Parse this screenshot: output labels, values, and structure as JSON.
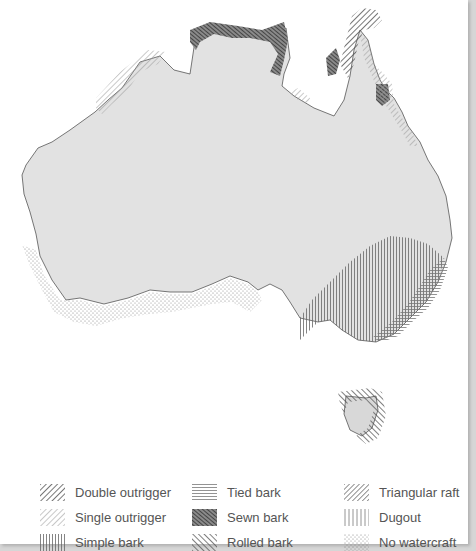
{
  "map": {
    "title": "Aboriginal watercraft distribution in Australia",
    "regions": [
      {
        "name": "Kimberley coast",
        "type": "Single outrigger"
      },
      {
        "name": "Arnhem Land coast",
        "type": "Sewn bark"
      },
      {
        "name": "Cape York",
        "type": "Double outrigger"
      },
      {
        "name": "Gulf of Carpentaria coast",
        "type": "Single outrigger"
      },
      {
        "name": "Queensland east coast",
        "type": "Single outrigger"
      },
      {
        "name": "Murray-Darling / south-east",
        "type": "Simple bark"
      },
      {
        "name": "NSW coast",
        "type": "Tied bark"
      },
      {
        "name": "Southern coast",
        "type": "No watercraft"
      },
      {
        "name": "Tasmania",
        "type": "Rolled bark"
      }
    ]
  },
  "legend": {
    "items": [
      {
        "id": "double-outrigger",
        "label": "Double outrigger"
      },
      {
        "id": "single-outrigger",
        "label": "Single outrigger"
      },
      {
        "id": "simple-bark",
        "label": "Simple bark"
      },
      {
        "id": "tied-bark",
        "label": "Tied bark"
      },
      {
        "id": "sewn-bark",
        "label": "Sewn bark"
      },
      {
        "id": "rolled-bark",
        "label": "Rolled bark"
      },
      {
        "id": "triangular-raft",
        "label": "Triangular raft"
      },
      {
        "id": "dugout",
        "label": "Dugout"
      },
      {
        "id": "no-watercraft",
        "label": "No watercraft"
      }
    ]
  },
  "colors": {
    "land": "#e3e3e3",
    "coast": "#555555",
    "hatch_dark": "#444444",
    "hatch_light": "#9a9a9a",
    "border": "#d6d6d6"
  }
}
